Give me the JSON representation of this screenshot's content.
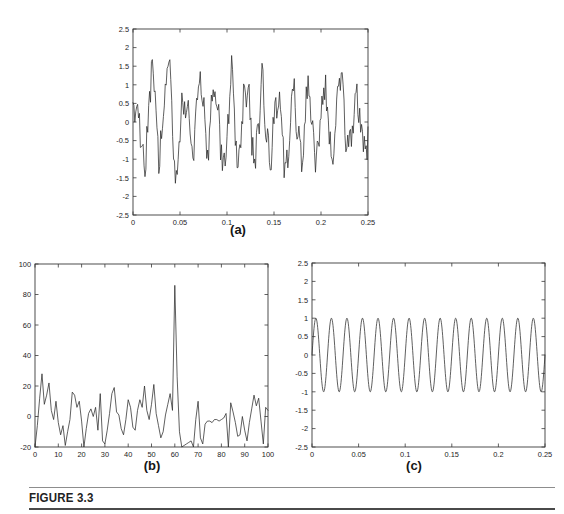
{
  "figure": {
    "caption": "FIGURE 3.3",
    "background_color": "#ffffff",
    "axis_color": "#3a3a3a",
    "trace_color": "#2b2b2b",
    "rule_top_color": "#8d8d8d",
    "rule_bottom_color": "#4a4a4a"
  },
  "labels": {
    "a": "(a)",
    "b": "(b)",
    "c": "(c)"
  },
  "chart_data": [
    {
      "id": "panel-a",
      "type": "line",
      "title": "",
      "subfigure": "(a)",
      "xlabel": "",
      "ylabel": "",
      "xlim": [
        0,
        0.25
      ],
      "ylim": [
        -2.5,
        2.5
      ],
      "xticks": [
        0,
        0.05,
        0.1,
        0.15,
        0.2,
        0.25
      ],
      "xticklabels": [
        "0",
        "0.05",
        "0.1",
        "0.15",
        "0.2",
        "0.25"
      ],
      "yticks": [
        -2.5,
        -2,
        -1.5,
        -1,
        -0.5,
        0,
        0.5,
        1,
        1.5,
        2,
        2.5
      ],
      "yticklabels": [
        "-2.5",
        "-2",
        "-1.5",
        "-1",
        "-0.5",
        "0",
        "0.5",
        "1",
        "1.5",
        "2",
        "2.5"
      ],
      "grid": false,
      "legend": "none",
      "description": "Noise-corrupted 60 Hz sinusoid in the time domain",
      "signal": {
        "kind": "sine_plus_noise",
        "frequency_hz": 60,
        "amplitude": 1.0,
        "noise_amplitude": 0.95,
        "duration_s": 0.25,
        "n_samples": 256
      }
    },
    {
      "id": "panel-b",
      "type": "line",
      "title": "",
      "subfigure": "(b)",
      "xlabel": "",
      "ylabel": "",
      "xlim": [
        0,
        100
      ],
      "ylim": [
        -20,
        100
      ],
      "xticks": [
        0,
        10,
        20,
        30,
        40,
        50,
        60,
        70,
        80,
        90,
        100
      ],
      "xticklabels": [
        "0",
        "10",
        "20",
        "30",
        "40",
        "50",
        "60",
        "70",
        "80",
        "90",
        "100"
      ],
      "yticks": [
        -20,
        0,
        20,
        40,
        60,
        80,
        100
      ],
      "yticklabels": [
        "-20",
        "0",
        "20",
        "40",
        "60",
        "80",
        "100"
      ],
      "grid": false,
      "legend": "none",
      "description": "Spectrum of the noisy signal showing a dominant peak at bin 60",
      "peak": {
        "x": 60,
        "y": 86
      },
      "noise_floor": [
        -22,
        22
      ],
      "values": [
        -25,
        -6,
        12,
        28,
        8,
        14,
        22,
        4,
        -2,
        10,
        -4,
        -12,
        -6,
        -19,
        -10,
        -2,
        16,
        14,
        6,
        10,
        -3,
        -21,
        -8,
        2,
        5,
        0,
        6,
        -9,
        15,
        -16,
        -18,
        -9,
        2,
        15,
        19,
        3,
        1,
        -8,
        -12,
        -2,
        11,
        6,
        -7,
        -9,
        4,
        11,
        6,
        20,
        4,
        -2,
        8,
        21,
        2,
        -6,
        -14,
        -10,
        1,
        8,
        15,
        4,
        86,
        26,
        -10,
        -21,
        -19,
        -18,
        -17,
        -16,
        -20,
        -2,
        10,
        -14,
        -18,
        -5,
        -3,
        -3,
        -4,
        -2,
        -2,
        -3,
        -2,
        -1,
        2,
        -21,
        9,
        3,
        -4,
        -13,
        -12,
        0,
        -9,
        -16,
        -4,
        5,
        14,
        7,
        12,
        -3,
        -18,
        6,
        4
      ]
    },
    {
      "id": "panel-c",
      "type": "line",
      "title": "",
      "subfigure": "(c)",
      "xlabel": "",
      "ylabel": "",
      "xlim": [
        0,
        0.25
      ],
      "ylim": [
        -2.5,
        2.5
      ],
      "xticks": [
        0,
        0.05,
        0.1,
        0.15,
        0.2,
        0.25
      ],
      "xticklabels": [
        "0",
        "0.05",
        "0.1",
        "0.15",
        "0.2",
        "0.25"
      ],
      "yticks": [
        -2.5,
        -2,
        -1.5,
        -1,
        -0.5,
        0,
        0.5,
        1,
        1.5,
        2,
        2.5
      ],
      "yticklabels": [
        "-2.5",
        "-2",
        "-1.5",
        "-1",
        "-0.5",
        "0",
        "0.5",
        "1",
        "1.5",
        "2",
        "2.5"
      ],
      "grid": false,
      "legend": "none",
      "description": "Recovered clean 60 Hz sinusoid of unit amplitude",
      "signal": {
        "kind": "sine",
        "frequency_hz": 60,
        "amplitude": 1.0,
        "duration_s": 0.25,
        "n_samples": 700
      }
    }
  ]
}
